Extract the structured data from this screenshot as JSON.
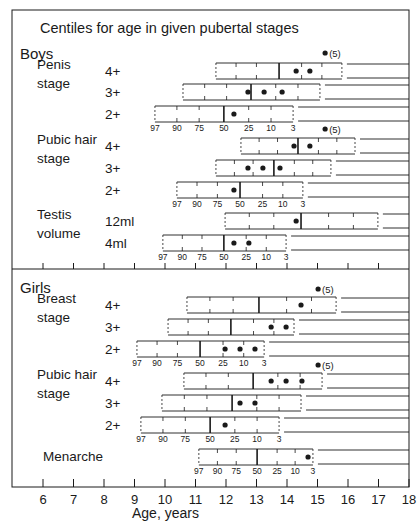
{
  "chart_data": {
    "type": "box",
    "title": "Centiles for age in given pubertal stages",
    "xlabel": "Age, years",
    "ylabel": "",
    "xlim": [
      6,
      18
    ],
    "x_ticks": [
      6,
      7,
      8,
      9,
      10,
      11,
      12,
      13,
      14,
      15,
      16,
      17,
      18
    ],
    "centile_labels": [
      "97",
      "90",
      "75",
      "50",
      "25",
      "10",
      "3"
    ],
    "legend_note": "(5)",
    "sections": [
      {
        "name": "Boys",
        "groups": [
          {
            "name_lines": [
              "Penis",
              "stage"
            ],
            "rows": [
              {
                "stage": "4+",
                "p97": 11.67,
                "p3": 15.8,
                "median": 13.74,
                "points": [
                  14.3,
                  14.75
                ],
                "outlier_5": 15.25,
                "show_centile_labels": false
              },
              {
                "stage": "3+",
                "p97": 10.59,
                "p3": 15.08,
                "median": 12.82,
                "points": [
                  12.72,
                  13.25,
                  13.84
                ],
                "outlier_5": null,
                "show_centile_labels": false
              },
              {
                "stage": "2+",
                "p97": 9.67,
                "p3": 14.2,
                "median": 11.93,
                "points": [
                  12.26
                ],
                "outlier_5": null,
                "show_centile_labels": true
              }
            ]
          },
          {
            "name_lines": [
              "Pubic hair",
              "stage"
            ],
            "rows": [
              {
                "stage": "4+",
                "p97": 12.49,
                "p3": 16.23,
                "median": 14.36,
                "points": [
                  14.23,
                  14.75
                ],
                "outlier_5": 15.25,
                "show_centile_labels": false
              },
              {
                "stage": "3+",
                "p97": 11.67,
                "p3": 15.44,
                "median": 13.57,
                "points": [
                  12.72,
                  13.21,
                  13.77
                ],
                "outlier_5": null,
                "show_centile_labels": false
              },
              {
                "stage": "2+",
                "p97": 10.39,
                "p3": 14.52,
                "median": 12.46,
                "points": [
                  12.26
                ],
                "outlier_5": null,
                "show_centile_labels": true
              }
            ]
          },
          {
            "name_lines": [
              "Testis",
              "volume"
            ],
            "rows": [
              {
                "stage": "12ml",
                "p97": 11.97,
                "p3": 16.98,
                "median": 14.46,
                "points": [
                  14.3
                ],
                "outlier_5": null,
                "show_centile_labels": false
              },
              {
                "stage": "4ml",
                "p97": 9.93,
                "p3": 13.97,
                "median": 11.93,
                "points": [
                  12.26,
                  12.75
                ],
                "outlier_5": null,
                "show_centile_labels": true
              }
            ]
          }
        ]
      },
      {
        "name": "Girls",
        "groups": [
          {
            "name_lines": [
              "Breast",
              "stage"
            ],
            "rows": [
              {
                "stage": "4+",
                "p97": 10.72,
                "p3": 15.61,
                "median": 13.08,
                "points": [
                  14.46
                ],
                "outlier_5": 15.02,
                "show_centile_labels": false
              },
              {
                "stage": "3+",
                "p97": 10.1,
                "p3": 14.23,
                "median": 12.16,
                "points": [
                  13.48,
                  13.97
                ],
                "outlier_5": null,
                "show_centile_labels": false
              },
              {
                "stage": "2+",
                "p97": 9.08,
                "p3": 13.25,
                "median": 11.15,
                "points": [
                  11.97,
                  12.46,
                  12.95
                ],
                "outlier_5": null,
                "show_centile_labels": true
              }
            ]
          },
          {
            "name_lines": [
              "Pubic hair",
              "stage"
            ],
            "rows": [
              {
                "stage": "4+",
                "p97": 10.62,
                "p3": 15.15,
                "median": 12.89,
                "points": [
                  13.48,
                  13.97,
                  14.49
                ],
                "outlier_5": 15.02,
                "show_centile_labels": false
              },
              {
                "stage": "3+",
                "p97": 9.9,
                "p3": 14.46,
                "median": 12.2,
                "points": [
                  12.46,
                  12.95
                ],
                "outlier_5": null,
                "show_centile_labels": false
              },
              {
                "stage": "2+",
                "p97": 9.21,
                "p3": 13.74,
                "median": 11.48,
                "points": [
                  11.97
                ],
                "outlier_5": null,
                "show_centile_labels": true
              }
            ]
          },
          {
            "name_lines": [
              "Menarche"
            ],
            "rows": [
              {
                "stage": "",
                "p97": 11.11,
                "p3": 14.85,
                "median": 13.02,
                "points": [
                  14.69
                ],
                "outlier_5": null,
                "show_centile_labels": true
              }
            ]
          }
        ]
      }
    ]
  },
  "layout_rows": {
    "boys": [
      {
        "group": 0,
        "row": 0,
        "y": 63,
        "outlier_y": 53
      },
      {
        "group": 0,
        "row": 1,
        "y": 84
      },
      {
        "group": 0,
        "row": 2,
        "y": 106
      },
      {
        "group": 1,
        "row": 0,
        "y": 138,
        "outlier_y": 129
      },
      {
        "group": 1,
        "row": 1,
        "y": 160
      },
      {
        "group": 1,
        "row": 2,
        "y": 182
      },
      {
        "group": 2,
        "row": 0,
        "y": 213
      },
      {
        "group": 2,
        "row": 1,
        "y": 235
      }
    ],
    "girls": [
      {
        "group": 0,
        "row": 0,
        "y": 297,
        "outlier_y": 289
      },
      {
        "group": 0,
        "row": 1,
        "y": 319
      },
      {
        "group": 0,
        "row": 2,
        "y": 341
      },
      {
        "group": 1,
        "row": 0,
        "y": 373,
        "outlier_y": 365
      },
      {
        "group": 1,
        "row": 1,
        "y": 395
      },
      {
        "group": 1,
        "row": 2,
        "y": 417
      },
      {
        "group": 2,
        "row": 0,
        "y": 449
      }
    ]
  }
}
